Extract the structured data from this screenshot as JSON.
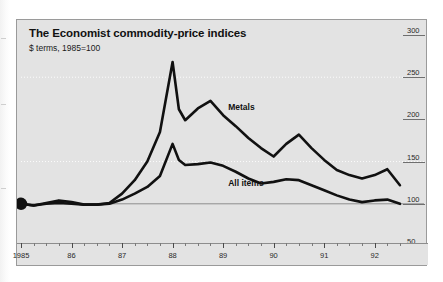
{
  "chart": {
    "title": "The Economist commodity-price indices",
    "subtitle": "$ terms, 1985=100",
    "labels": {
      "metals": "Metals",
      "all_items": "All items"
    }
  },
  "chart_data": {
    "type": "line",
    "title": "The Economist commodity-price indices",
    "subtitle": "$ terms, 1985=100",
    "xlabel": "",
    "ylabel": "",
    "xlim": [
      1985.0,
      1992.6
    ],
    "ylim": [
      50,
      300
    ],
    "yticks": [
      300,
      250,
      200,
      150,
      100,
      50
    ],
    "ytick_labels": [
      "300",
      "250",
      "200",
      "150",
      "100",
      "50"
    ],
    "xticks": [
      1985,
      1986,
      1987,
      1988,
      1989,
      1990,
      1991,
      1992
    ],
    "xtick_labels": [
      "1985",
      "86",
      "87",
      "88",
      "89",
      "90",
      "91",
      "92"
    ],
    "minor_xticks_per_year": 4,
    "grid": "dotted horizontal gridlines at 250 and 150, solid baseline at 100",
    "baseline": 100,
    "legend": "inline series labels",
    "start_marker": {
      "x": 1985.0,
      "y": 100,
      "shape": "filled-circle"
    },
    "x": [
      1985.0,
      1985.25,
      1985.5,
      1985.75,
      1986.0,
      1986.25,
      1986.5,
      1986.75,
      1987.0,
      1987.25,
      1987.5,
      1987.75,
      1988.0,
      1988.125,
      1988.25,
      1988.5,
      1988.75,
      1989.0,
      1989.25,
      1989.5,
      1989.75,
      1990.0,
      1990.25,
      1990.5,
      1990.75,
      1991.0,
      1991.25,
      1991.5,
      1991.75,
      1992.0,
      1992.25,
      1992.5
    ],
    "series": [
      {
        "name": "Metals",
        "color": "#111111",
        "values": [
          100,
          98,
          100,
          101,
          100,
          99,
          99,
          101,
          112,
          128,
          150,
          185,
          268,
          212,
          199,
          213,
          222,
          205,
          192,
          178,
          166,
          156,
          171,
          182,
          166,
          152,
          140,
          134,
          130,
          134,
          141,
          122
        ]
      },
      {
        "name": "All items",
        "color": "#111111",
        "values": [
          100,
          98,
          101,
          104,
          102,
          99,
          99,
          100,
          105,
          112,
          120,
          133,
          171,
          152,
          146,
          147,
          149,
          145,
          138,
          130,
          124,
          126,
          129,
          128,
          122,
          116,
          110,
          105,
          102,
          104,
          105,
          100
        ]
      }
    ],
    "annotations": [
      {
        "text": "Metals",
        "x": 1989.1,
        "y": 213
      },
      {
        "text": "All items",
        "x": 1989.1,
        "y": 123
      }
    ]
  }
}
